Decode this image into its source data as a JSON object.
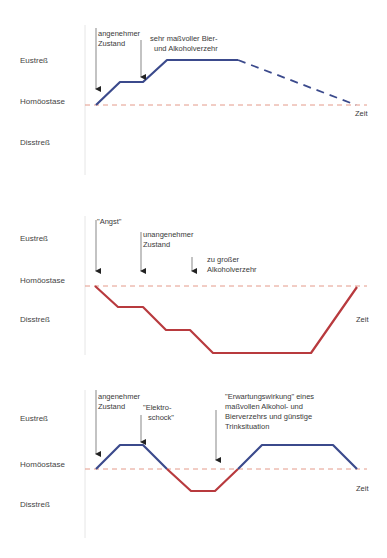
{
  "colors": {
    "eustress_line": "#3b4a8c",
    "distress_line": "#b83a3e",
    "baseline": "#e49a8a",
    "axis": "#e2e2e2",
    "arrow": "#222222"
  },
  "axis_labels": {
    "eustress": "Eustreß",
    "homeostasis": "Homöostase",
    "distress": "Disstreß",
    "time": "Zeit"
  },
  "panels": [
    {
      "id": "panel-1",
      "annotations": [
        {
          "lines": [
            "angenehmer",
            "Zustand"
          ]
        },
        {
          "lines": [
            "sehr maßvoller Bier-",
            "und Alkoholverzehr"
          ]
        }
      ],
      "curve": "Homöostase → Eustreß (zwei Stufen), Plateau, gestrichelter Abfall zurück zur Homöostase"
    },
    {
      "id": "panel-2",
      "annotations": [
        {
          "lines": [
            "\"Angst\""
          ]
        },
        {
          "lines": [
            "unangenehmer",
            "Zustand"
          ]
        },
        {
          "lines": [
            "zu großer",
            "Alkoholverzehr"
          ]
        }
      ],
      "curve": "Homöostase → Disstreß (drei Stufen), Plateau, Anstieg zurück zur Homöostase"
    },
    {
      "id": "panel-3",
      "annotations": [
        {
          "lines": [
            "angenehmer",
            "Zustand"
          ]
        },
        {
          "lines": [
            "\"Elektro-",
            "schock\""
          ]
        },
        {
          "lines": [
            "\"Erwartungswirkung\" eines",
            "maßvollen Alkohol- und",
            "Bierverzehrs und günstige",
            "Trinksituation"
          ]
        }
      ],
      "curve": "Eustreß → Disstreß → Eustreß → Homöostase"
    }
  ]
}
